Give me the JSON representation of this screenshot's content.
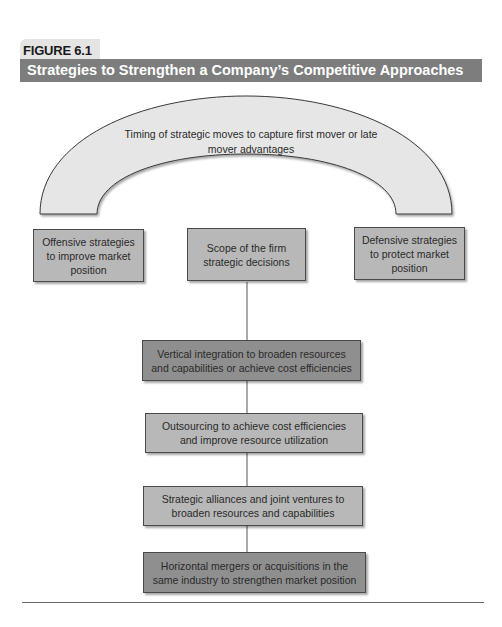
{
  "figure": {
    "label": "FIGURE 6.1",
    "title": "Strategies to Strengthen a Company’s Competitive Approaches"
  },
  "arch": {
    "text": "Timing of strategic moves to capture first mover or late mover advantages",
    "fill": "#e6e6e6"
  },
  "top_row": [
    {
      "id": "offensive",
      "text": "Offensive strategies to improve market position"
    },
    {
      "id": "scope",
      "text": "Scope of the firm strategic decisions"
    },
    {
      "id": "defensive",
      "text": "Defensive strategies to protect market position"
    }
  ],
  "scope_stack": [
    {
      "id": "vertical",
      "text": "Vertical integration to broaden resources and capabilities or achieve cost efficiencies"
    },
    {
      "id": "outsourcing",
      "text": "Outsourcing to achieve cost efficiencies and improve resource utilization"
    },
    {
      "id": "alliances",
      "text": "Strategic alliances and joint ventures to broaden resources and capabilities"
    },
    {
      "id": "horizontal",
      "text": "Horizontal mergers or acquisitions in the same industry to strengthen market position"
    }
  ],
  "colors": {
    "title_bar": "#7d7d7d",
    "box_light": "#b8b8b8",
    "box_dark": "#8f8f8f",
    "connector": "#555555"
  }
}
